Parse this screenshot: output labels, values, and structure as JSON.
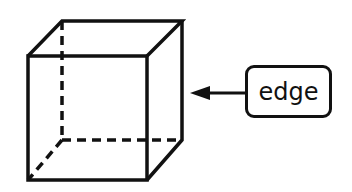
{
  "diagram": {
    "label": {
      "text": "edge"
    },
    "colors": {
      "stroke": "#111111",
      "background": "#ffffff"
    }
  }
}
